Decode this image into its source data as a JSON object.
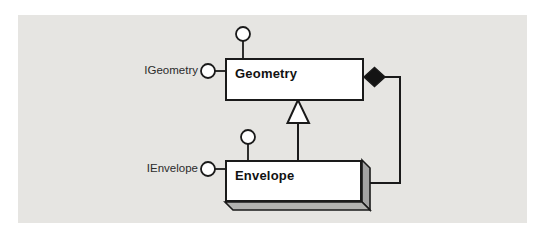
{
  "panel": {
    "background": "#e6e5e2"
  },
  "classes": {
    "geometry": {
      "name": "Geometry",
      "interface": "IGeometry",
      "kind": "abstract-class-box"
    },
    "envelope": {
      "name": "Envelope",
      "interface": "IEnvelope",
      "kind": "coclass-3d-box"
    }
  },
  "icons": {
    "interface_lollipop": "small hollow circle on stem",
    "inheritance_arrow": "hollow upward triangle from Envelope to Geometry",
    "composition_diamond": "solid black diamond on Geometry right edge"
  },
  "colors": {
    "line": "#1a1a1a",
    "box_fill": "#ffffff",
    "panel_bg": "#e6e5e2",
    "shadow_right": "#a3a3a3",
    "shadow_bottom": "#b2b2b0",
    "diamond_fill": "#141414"
  }
}
